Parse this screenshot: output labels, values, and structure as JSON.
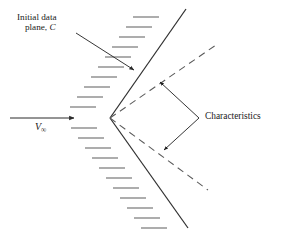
{
  "figure": {
    "type": "supersonic-wedge-characteristics-diagram",
    "background_color": "#ffffff",
    "line_color": "#3a3a3a",
    "text_color": "#1a1a1a",
    "width": 283,
    "height": 234
  },
  "labels": {
    "initial_data_line1": "Initial data",
    "initial_data_line2_prefix": "plane, ",
    "initial_data_line2_symbol": "C",
    "characteristics": "Characteristics",
    "freestream_symbol": "V",
    "freestream_subscript": "∞"
  },
  "geometry": {
    "apex": [
      110,
      118
    ],
    "upper_wedge_end": [
      186,
      9
    ],
    "lower_wedge_end": [
      188,
      228
    ],
    "upper_characteristic_end": [
      216,
      45
    ],
    "lower_characteristic_end": [
      208,
      190
    ],
    "freestream_arrow": {
      "from": [
        10,
        118
      ],
      "to": [
        78,
        118
      ]
    },
    "initial_data_leader": {
      "from": [
        76,
        33
      ],
      "to": [
        138,
        73
      ]
    },
    "characteristics_leader_vertex": [
      199,
      118
    ],
    "characteristics_upper_arrow_tip": [
      157,
      79
    ],
    "characteristics_lower_arrow_tip": [
      161,
      153
    ],
    "hatch_count_upper": 10,
    "hatch_count_lower": 11,
    "hatch_length": 26,
    "dash_pattern": "7,5"
  }
}
